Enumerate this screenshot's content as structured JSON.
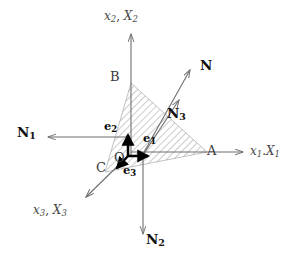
{
  "figure": {
    "type": "vector-diagram",
    "background_color": "#ffffff",
    "axis_color": "#6e6e6e",
    "hatch_color": "#8f8f8f",
    "basis_vector_color": "#000000",
    "normal_vector_color": "#6e6e6e",
    "axes": [
      {
        "id": "x1",
        "name": "x1-axis",
        "label": "x",
        "sub": "1",
        "label2": "X",
        "sub2": "1",
        "separator": ".",
        "label_x": 250,
        "label_y": 145,
        "direction": "right"
      },
      {
        "id": "x2",
        "name": "x2-axis",
        "label": "x",
        "sub": "2",
        "label2": "X",
        "sub2": "2",
        "separator": ",",
        "label_x": 104,
        "label_y": 10,
        "direction": "up"
      },
      {
        "id": "x3",
        "name": "x3-axis",
        "label": "x",
        "sub": "3",
        "label2": "X",
        "sub2": "3",
        "separator": ",",
        "label_x": 33,
        "label_y": 204,
        "direction": "down-left"
      }
    ],
    "points": [
      {
        "id": "A",
        "name": "point-a",
        "label": "A",
        "x": 207,
        "y": 144
      },
      {
        "id": "B",
        "name": "point-b",
        "label": "B",
        "x": 110,
        "y": 70
      },
      {
        "id": "C",
        "name": "point-c",
        "label": "C",
        "x": 96,
        "y": 161
      },
      {
        "id": "O",
        "name": "point-o",
        "label": "O",
        "x": 114,
        "y": 151
      }
    ],
    "normals": [
      {
        "id": "N",
        "name": "traction-vector-n",
        "label": "N",
        "sub": "",
        "label_x": 200,
        "label_y": 59
      },
      {
        "id": "N1",
        "name": "traction-vector-n1",
        "label": "N",
        "sub": "1",
        "label_x": 17,
        "label_y": 126
      },
      {
        "id": "N2",
        "name": "traction-vector-n2",
        "label": "N",
        "sub": "2",
        "label_x": 146,
        "label_y": 233
      },
      {
        "id": "N3",
        "name": "traction-vector-n3",
        "label": "N",
        "sub": "3",
        "label_x": 167,
        "label_y": 107
      }
    ],
    "basis_vectors": [
      {
        "id": "e1",
        "name": "basis-vector-e1",
        "label": "e",
        "sub": "1",
        "label_x": 143,
        "label_y": 133
      },
      {
        "id": "e2",
        "name": "basis-vector-e2",
        "label": "e",
        "sub": "2",
        "label_x": 104,
        "label_y": 121
      },
      {
        "id": "e3",
        "name": "basis-vector-e3",
        "label": "e",
        "sub": "3",
        "label_x": 123,
        "label_y": 165
      }
    ],
    "hatched_region": {
      "name": "hatched-plane-abc",
      "vertices": "A(207,152) B(131,83) C(105,172)",
      "fill": "diagonal-hatch"
    }
  }
}
